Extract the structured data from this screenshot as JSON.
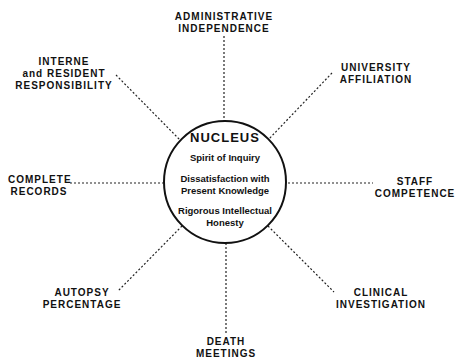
{
  "nucleus": {
    "title": "NUCLEUS",
    "items": [
      "Spirit of Inquiry",
      "Dissatisfaction with",
      "Present Knowledge",
      "Rigorous Intellectual",
      "Honesty"
    ]
  },
  "spokes": {
    "top": [
      "ADMINISTRATIVE",
      "INDEPENDENCE"
    ],
    "top_right": [
      "UNIVERSITY",
      "AFFILIATION"
    ],
    "right": [
      "STAFF",
      "COMPETENCE"
    ],
    "bottom_right": [
      "CLINICAL",
      "INVESTIGATION"
    ],
    "bottom": [
      "DEATH",
      "MEETINGS"
    ],
    "bottom_left": [
      "AUTOPSY",
      "PERCENTAGE"
    ],
    "left": [
      "COMPLETE",
      "RECORDS"
    ],
    "top_left": [
      "INTERNE",
      "and RESIDENT",
      "RESPONSIBILITY"
    ]
  }
}
